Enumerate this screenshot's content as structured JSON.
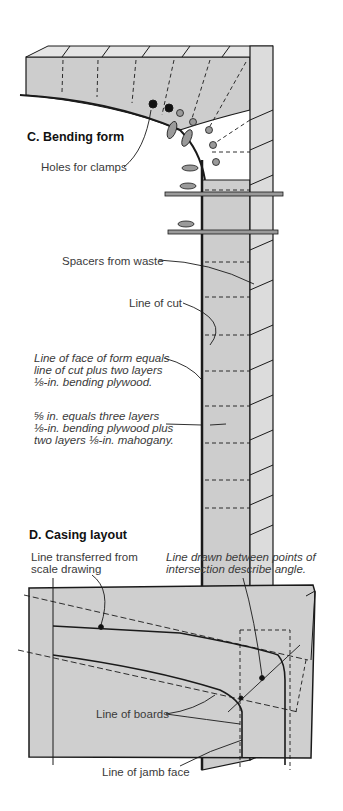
{
  "figure_c": {
    "title": "C. Bending form",
    "labels": {
      "holes": "Holes for clamps",
      "spacers": "Spacers from waste",
      "line_of_cut": "Line of cut",
      "face_line1": "Line of face of form equals",
      "face_line2": "line of cut plus two layers",
      "face_line3": "⅛-in. bending plywood.",
      "thick_line1": "⅝ in. equals three layers",
      "thick_line2": "⅛-in. bending plywood plus",
      "thick_line3": "two layers ⅛-in. mahogany."
    }
  },
  "figure_d": {
    "title": "D. Casing layout",
    "labels": {
      "transferred_line1": "Line transferred from",
      "transferred_line2": "scale drawing",
      "drawn_line1": "Line drawn between points of",
      "drawn_line2": "intersection describe angle.",
      "boards": "Line of boards",
      "jamb": "Line of jamb face"
    }
  },
  "colors": {
    "panel_fill": "#cfcfcf",
    "line": "#1a1a1a",
    "text": "#3a3a3a"
  }
}
